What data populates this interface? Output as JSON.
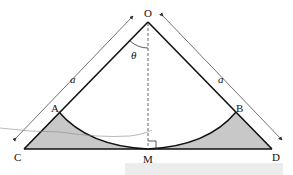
{
  "diagram": {
    "points": {
      "O": "O",
      "A": "A",
      "B": "B",
      "C": "C",
      "D": "D",
      "M": "M"
    },
    "angle_label": "θ",
    "side_label_left": "a",
    "side_label_right": "a",
    "colors": {
      "line": "#111111",
      "shade": "#c8c8c8",
      "dashed": "#555555",
      "stray_line": "#8a8a8a",
      "band": "#ececec"
    }
  }
}
